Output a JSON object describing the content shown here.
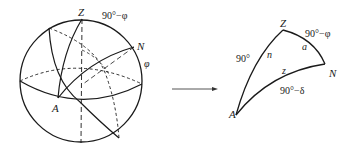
{
  "figure": {
    "sphere": {
      "labels": {
        "zenith": "Z",
        "pole": "N",
        "star": "A",
        "colatitude": "90°−φ",
        "latitude": "φ"
      }
    },
    "arrow": {
      "direction": "right"
    },
    "triangle": {
      "vertices": {
        "zenith": "Z",
        "pole": "N",
        "star": "A"
      },
      "sides": {
        "ZN": "90°−φ",
        "ZA": "90°",
        "NA": "90°−δ"
      },
      "angles": {
        "at_Z": "n",
        "at_N": "a",
        "interior_NA": "z"
      }
    }
  },
  "colors": {
    "stroke": "#1a1a1a",
    "background": "#ffffff"
  }
}
